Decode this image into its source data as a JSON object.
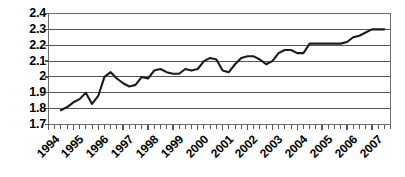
{
  "chart_data": {
    "type": "line",
    "title": "",
    "subtitle": "",
    "xlabel": "",
    "ylabel": "",
    "xlim": [
      1994.0,
      2007.75
    ],
    "ylim": [
      1.7,
      2.4
    ],
    "grid": true,
    "grid_axis": "y",
    "legend": false,
    "legend_position": "none",
    "line_color": "#1a1a1a",
    "axis_color": "#808080",
    "grid_color": "#555555",
    "background_color": "#ffffff",
    "ytick_labels": [
      "2.4",
      "2.3",
      "2.2",
      "2.1",
      "2",
      "1.9",
      "1.8",
      "1.7"
    ],
    "ytick_values": [
      2.4,
      2.3,
      2.2,
      2.1,
      2.0,
      1.9,
      1.8,
      1.7
    ],
    "xtick_labels": [
      "1994",
      "1995",
      "1996",
      "1997",
      "1998",
      "1999",
      "2000",
      "2001",
      "2002",
      "2003",
      "2004",
      "2005",
      "2006",
      "2007"
    ],
    "xtick_values": [
      1994,
      1995,
      1996,
      1997,
      1998,
      1999,
      2000,
      2001,
      2002,
      2003,
      2004,
      2005,
      2006,
      2007
    ],
    "x_minor_ticks_per_year": 4,
    "series": [
      {
        "name": "series-1",
        "x": [
          1994.5,
          1994.75,
          1995.0,
          1995.25,
          1995.5,
          1995.75,
          1996.0,
          1996.25,
          1996.5,
          1996.75,
          1997.0,
          1997.25,
          1997.5,
          1997.75,
          1998.0,
          1998.25,
          1998.5,
          1998.75,
          1999.0,
          1999.25,
          1999.5,
          1999.75,
          2000.0,
          2000.25,
          2000.5,
          2000.75,
          2001.0,
          2001.25,
          2001.5,
          2001.75,
          2002.0,
          2002.25,
          2002.5,
          2002.75,
          2003.0,
          2003.25,
          2003.5,
          2003.75,
          2004.0,
          2004.25,
          2004.5,
          2004.75,
          2005.0,
          2005.25,
          2005.5,
          2005.75,
          2006.0,
          2006.25,
          2006.5,
          2006.75,
          2007.0,
          2007.25,
          2007.5
        ],
        "values": [
          1.79,
          1.81,
          1.84,
          1.86,
          1.9,
          1.83,
          1.88,
          2.0,
          2.03,
          1.99,
          1.96,
          1.94,
          1.95,
          2.0,
          1.99,
          2.04,
          2.05,
          2.03,
          2.02,
          2.02,
          2.05,
          2.04,
          2.05,
          2.1,
          2.12,
          2.11,
          2.04,
          2.03,
          2.08,
          2.12,
          2.13,
          2.13,
          2.11,
          2.08,
          2.1,
          2.15,
          2.17,
          2.17,
          2.15,
          2.15,
          2.21,
          2.21,
          2.21,
          2.21,
          2.21,
          2.21,
          2.22,
          2.25,
          2.26,
          2.28,
          2.3,
          2.3,
          2.3
        ]
      }
    ]
  }
}
